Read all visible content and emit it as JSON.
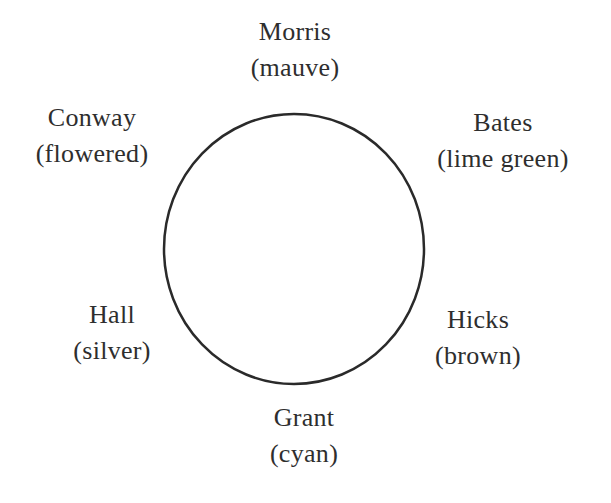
{
  "diagram": {
    "type": "seating-circle",
    "circle": {
      "cx": 294,
      "cy": 249,
      "rx": 130,
      "ry": 135,
      "stroke": "#2a2a2a",
      "stroke_width": 2.5
    },
    "seats": [
      {
        "position": "top",
        "name": "Morris",
        "color": "(mauve)",
        "x": 295,
        "y": 14
      },
      {
        "position": "upper-left",
        "name": "Conway",
        "color": "(flowered)",
        "x": 92,
        "y": 100
      },
      {
        "position": "upper-right",
        "name": "Bates",
        "color": "(lime green)",
        "x": 503,
        "y": 105
      },
      {
        "position": "lower-left",
        "name": "Hall",
        "color": "(silver)",
        "x": 112,
        "y": 297
      },
      {
        "position": "lower-right",
        "name": "Hicks",
        "color": "(brown)",
        "x": 478,
        "y": 302
      },
      {
        "position": "bottom",
        "name": "Grant",
        "color": "(cyan)",
        "x": 304,
        "y": 400
      }
    ]
  }
}
